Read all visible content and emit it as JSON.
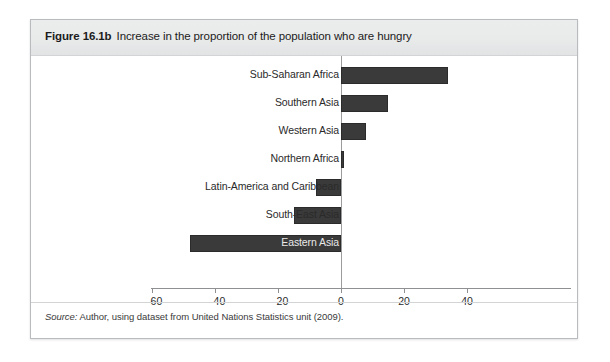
{
  "figure": {
    "label": "Figure 16.1b",
    "caption": "Increase in the proportion of the population who are hungry",
    "source_prefix": "Source:",
    "source_text": " Author, using dataset from United Nations Statistics unit (2009)."
  },
  "chart_data": {
    "type": "bar",
    "orientation": "horizontal",
    "title": "Increase in the proportion of the population who are hungry",
    "xlabel": "",
    "ylabel": "",
    "xlim": [
      -60,
      40
    ],
    "grid": false,
    "legend": false,
    "bar_color": "#3a3a3a",
    "axis_color": "#8e9092",
    "categories": [
      "Sub-Saharan Africa",
      "Southern Asia",
      "Western Asia",
      "Northern Africa",
      "Latin-America and Caribbean",
      "South-East Asia",
      "Eastern Asia"
    ],
    "values": [
      34,
      15,
      8,
      1,
      -8,
      -15,
      -48
    ],
    "xticks": [
      -60,
      -40,
      -20,
      0,
      20,
      40
    ],
    "xticklabels": [
      "– 60",
      "– 40",
      "– 20",
      "0",
      "20",
      "40"
    ]
  }
}
